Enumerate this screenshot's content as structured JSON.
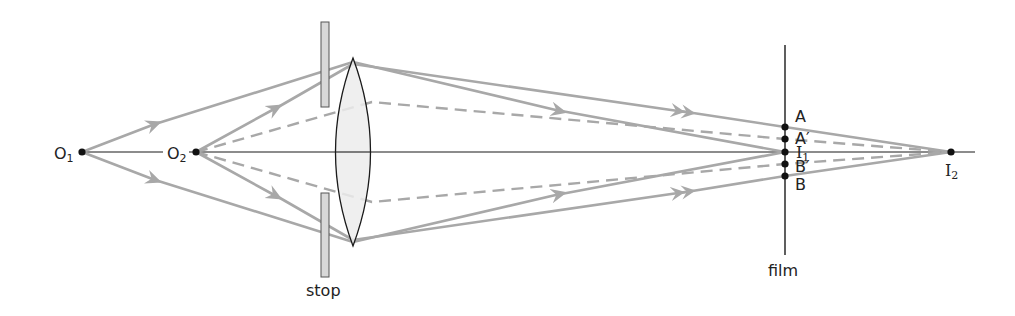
{
  "diagram": {
    "type": "ray-optics",
    "colors": {
      "axis": "#1a1a1a",
      "ray": "#a8a8a8",
      "lens_fill": "#ececec",
      "lens_stroke": "#1a1a1a",
      "stop_fill": "#d8d8d8",
      "stop_stroke": "#555555",
      "point": "#111111"
    },
    "labels": {
      "O1": "O",
      "O1_sub": "1",
      "O2": "O",
      "O2_sub": "2",
      "I1": "I",
      "I1_sub": "1",
      "I2": "I",
      "I2_sub": "2",
      "A": "A",
      "A_prime": "A′",
      "B_prime": "B′",
      "B": "B",
      "stop": "stop",
      "film": "film"
    },
    "elements": [
      {
        "name": "object-point-O1",
        "x": 82,
        "y": 152
      },
      {
        "name": "object-point-O2",
        "x": 196,
        "y": 152
      },
      {
        "name": "stop",
        "x": 325,
        "upper": [
          22,
          107
        ],
        "lower": [
          193,
          277
        ]
      },
      {
        "name": "converging-lens",
        "cx": 353,
        "top": 58,
        "bottom": 246
      },
      {
        "name": "film",
        "x": 785,
        "y_range": [
          45,
          255
        ]
      },
      {
        "name": "image-point-I1",
        "x": 785,
        "y": 152
      },
      {
        "name": "image-point-I2",
        "x": 951,
        "y": 152
      },
      {
        "name": "film-points",
        "A": 127,
        "A_prime": 139,
        "I1": 152,
        "B_prime": 164,
        "B": 176
      }
    ]
  }
}
